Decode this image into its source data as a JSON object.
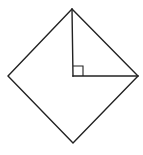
{
  "diagram": {
    "colors": {
      "background": "#ffffff",
      "stroke": "#222222"
    },
    "vertices": {
      "top": [
        72,
        9
      ],
      "right": [
        138,
        76
      ],
      "bottom": [
        73,
        143
      ],
      "left": [
        8,
        76
      ],
      "center": [
        73,
        76
      ]
    },
    "segments": [
      {
        "name": "half-diagonal-vertical",
        "from": "center",
        "to": "top"
      },
      {
        "name": "half-diagonal-horizontal",
        "from": "center",
        "to": "right"
      }
    ],
    "right_angle_marker": {
      "at": "center",
      "size": 10
    },
    "labels": []
  }
}
